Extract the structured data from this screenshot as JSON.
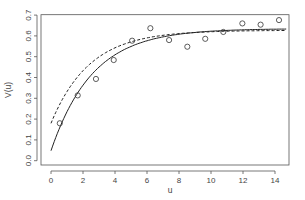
{
  "chart_data": {
    "type": "scatter",
    "title": "",
    "xlabel": "u",
    "ylabel": "V(u)",
    "xlim": [
      -0.6,
      14.9
    ],
    "ylim": [
      -0.02,
      0.7
    ],
    "grid": false,
    "legend": null,
    "x_ticks": [
      0,
      2,
      4,
      6,
      8,
      10,
      12,
      14
    ],
    "y_ticks": [
      0.0,
      0.1,
      0.2,
      0.3,
      0.4,
      0.5,
      0.6,
      0.7
    ],
    "y_tick_labels": [
      "0.0",
      "0.1",
      "0.2",
      "0.3",
      "0.4",
      "0.5",
      "0.6",
      "0.7"
    ],
    "series": [
      {
        "name": "empirical variogram",
        "style": "points",
        "marker": "open-circle",
        "x": [
          0.55,
          1.67,
          2.81,
          3.92,
          5.07,
          6.21,
          7.38,
          8.52,
          9.64,
          10.77,
          11.96,
          13.1,
          14.25
        ],
        "y": [
          0.18,
          0.314,
          0.393,
          0.484,
          0.577,
          0.637,
          0.58,
          0.548,
          0.586,
          0.619,
          0.66,
          0.654,
          0.676
        ]
      },
      {
        "name": "fitted model (solid)",
        "style": "solid-line",
        "model": "exponential",
        "nugget": 0.048,
        "sill": 0.635,
        "range": 2.6
      },
      {
        "name": "fitted model (dashed)",
        "style": "dashed-line",
        "model": "exponential",
        "nugget": 0.18,
        "sill": 0.627,
        "range": 2.4
      }
    ]
  }
}
